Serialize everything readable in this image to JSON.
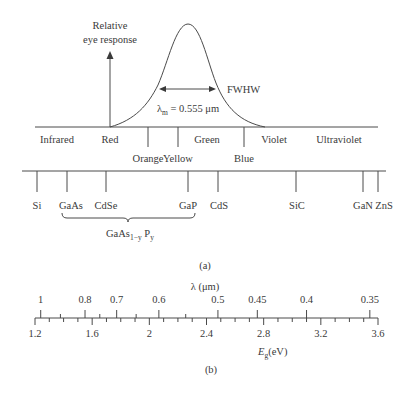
{
  "panel_a": {
    "eye_response": {
      "label_line1": "Relative",
      "label_line2": "eye response",
      "fwhw_label": "FWHW",
      "peak_label_lambda": "λ",
      "peak_label_sub": "m",
      "peak_label_value": " = 0.555 μm"
    },
    "spectrum_bands": [
      {
        "label": "Infrared",
        "x": 57,
        "row": 1
      },
      {
        "label": "Red",
        "x": 110,
        "row": 1
      },
      {
        "label": "Orange",
        "x": 148,
        "row": 2
      },
      {
        "label": "Yellow",
        "x": 178,
        "row": 2
      },
      {
        "label": "Green",
        "x": 207,
        "row": 1
      },
      {
        "label": "Blue",
        "x": 244,
        "row": 2
      },
      {
        "label": "Violet",
        "x": 274,
        "row": 1
      },
      {
        "label": "Ultraviolet",
        "x": 339,
        "row": 1
      }
    ],
    "spectrum_ticks_x": [
      148,
      178,
      244
    ],
    "semiconductors": [
      {
        "label": "Si",
        "x": 37
      },
      {
        "label": "GaAs",
        "x": 67
      },
      {
        "label": "CdSe",
        "x": 106
      },
      {
        "label": "GaP",
        "x": 188
      },
      {
        "label": "CdS",
        "x": 218
      },
      {
        "label": "SiC",
        "x": 296
      },
      {
        "label": "GaN",
        "x": 363
      },
      {
        "label": "ZnS",
        "x": 379
      }
    ],
    "alloy_label": "GaAs",
    "alloy_sub1": "1−y",
    "alloy_mid": " P",
    "alloy_sub2": "y",
    "caption": "(a)"
  },
  "panel_b": {
    "top_axis_label": "λ (μm)",
    "bottom_axis_label_main": "E",
    "bottom_axis_label_sub": "g",
    "bottom_axis_label_unit": "(eV)",
    "caption": "(b)"
  },
  "chart_data": {
    "type": "table",
    "eye_response_peak_um": 0.555,
    "energy_axis": {
      "label": "Eg (eV)",
      "range": [
        1.2,
        3.6
      ],
      "ticks": [
        "1.2",
        "1.6",
        "2",
        "2.4",
        "2.8",
        "3.2",
        "3.6"
      ]
    },
    "wavelength_axis": {
      "label": "λ (μm)",
      "ticks": [
        "1",
        "0.8",
        "0.7",
        "0.6",
        "0.5",
        "0.45",
        "0.4",
        "0.35"
      ]
    },
    "spectral_regions": [
      "Infrared",
      "Red",
      "Orange",
      "Yellow",
      "Green",
      "Blue",
      "Violet",
      "Ultraviolet"
    ],
    "semiconductor_bandgaps_eV": {
      "Si": 1.21,
      "GaAs": 1.42,
      "CdSe": 1.7,
      "GaP": 2.27,
      "CdS": 2.42,
      "SiC": 2.97,
      "GaN": 3.44,
      "ZnS": 3.54
    },
    "alloy_range": {
      "name": "GaAs1−y Py",
      "from": "GaAs",
      "to": "GaP"
    }
  }
}
